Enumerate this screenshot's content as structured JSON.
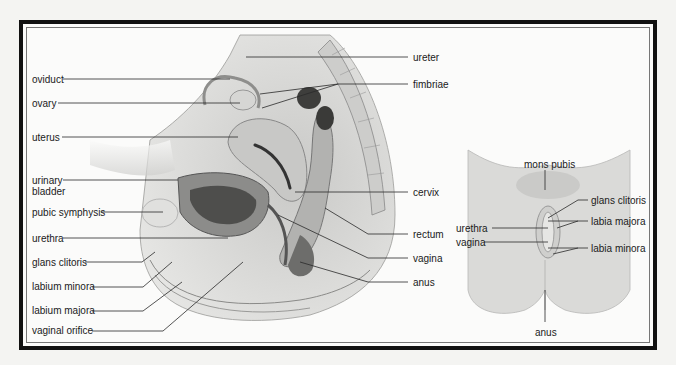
{
  "sagittal_view": {
    "labels_left": [
      {
        "id": "oviduct",
        "text": "oviduct",
        "x": 32,
        "y": 74
      },
      {
        "id": "ovary",
        "text": "ovary",
        "x": 32,
        "y": 98
      },
      {
        "id": "uterus",
        "text": "uterus",
        "x": 32,
        "y": 132
      },
      {
        "id": "urinary-bladder-1",
        "text": "urinary",
        "x": 32,
        "y": 175
      },
      {
        "id": "urinary-bladder-2",
        "text": "bladder",
        "x": 32,
        "y": 186
      },
      {
        "id": "pubic-symphysis",
        "text": "pubic symphysis",
        "x": 32,
        "y": 207
      },
      {
        "id": "urethra",
        "text": "urethra",
        "x": 32,
        "y": 233
      },
      {
        "id": "glans-clitoris",
        "text": "glans clitoris",
        "x": 32,
        "y": 257
      },
      {
        "id": "labium-minora",
        "text": "labium minora",
        "x": 32,
        "y": 281
      },
      {
        "id": "labium-majora",
        "text": "labium majora",
        "x": 32,
        "y": 305
      },
      {
        "id": "vaginal-orifice",
        "text": "vaginal orifice",
        "x": 32,
        "y": 325
      }
    ],
    "labels_right": [
      {
        "id": "ureter",
        "text": "ureter",
        "x": 413,
        "y": 52
      },
      {
        "id": "fimbriae",
        "text": "fimbriae",
        "x": 413,
        "y": 80
      },
      {
        "id": "cervix",
        "text": "cervix",
        "x": 413,
        "y": 189
      },
      {
        "id": "rectum",
        "text": "rectum",
        "x": 413,
        "y": 230
      },
      {
        "id": "vagina",
        "text": "vagina",
        "x": 413,
        "y": 255
      },
      {
        "id": "anus",
        "text": "anus",
        "x": 413,
        "y": 277
      }
    ]
  },
  "external_view": {
    "labels": [
      {
        "id": "mons-pubis",
        "text": "mons pubis",
        "x": 524,
        "y": 159
      },
      {
        "id": "glans-clitoris-ext",
        "text": "glans clitoris",
        "x": 591,
        "y": 197
      },
      {
        "id": "labia-majora",
        "text": "labia majora",
        "x": 591,
        "y": 217
      },
      {
        "id": "urethra-ext",
        "text": "urethra",
        "x": 456,
        "y": 224
      },
      {
        "id": "vagina-ext",
        "text": "vagina",
        "x": 456,
        "y": 238
      },
      {
        "id": "labia-minora",
        "text": "labia minora",
        "x": 591,
        "y": 245
      },
      {
        "id": "anus-ext",
        "text": "anus",
        "x": 535,
        "y": 328
      }
    ]
  },
  "colors": {
    "frame": "#111111",
    "background": "#fbfbfa",
    "tissue_light": "#d9d9d7",
    "tissue_mid": "#b4b4b2",
    "tissue_dark": "#6a6a68",
    "leader_line": "#2a2a2a"
  }
}
